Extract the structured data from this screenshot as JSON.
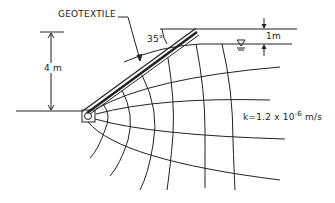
{
  "diagram": {
    "labels": {
      "geotextile": "GEOTEXTILE",
      "angle": "35°",
      "height": "4 m",
      "water_depth": "1m",
      "permeability_prefix": "k=1.2 x 10",
      "permeability_exp": "-6",
      "permeability_unit": " m/s"
    },
    "colors": {
      "line": "#222222",
      "background": "#ffffff"
    }
  }
}
